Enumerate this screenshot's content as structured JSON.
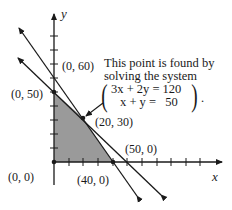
{
  "diagram": {
    "type": "linear-programming-feasible-region",
    "axes": {
      "x_label": "x",
      "y_label": "y",
      "tick_interval": 10
    },
    "lines": [
      {
        "equation": "3x + 2y = 120",
        "intercepts": [
          [
            0,
            60
          ],
          [
            40,
            0
          ]
        ]
      },
      {
        "equation": "x + y = 50",
        "intercepts": [
          [
            0,
            50
          ],
          [
            50,
            0
          ]
        ]
      }
    ],
    "feasible_region_vertices": [
      [
        0,
        0
      ],
      [
        0,
        50
      ],
      [
        20,
        30
      ],
      [
        40,
        0
      ]
    ],
    "shade_color": "#9a9a9a",
    "line_color": "#1a1a1a"
  },
  "labels": {
    "y_axis": "y",
    "x_axis": "x",
    "p_0_60": "(0, 60)",
    "p_0_50": "(0, 50)",
    "p_20_30": "(20, 30)",
    "p_50_0": "(50, 0)",
    "p_0_0": "(0, 0)",
    "p_40_0": "(40, 0)"
  },
  "annotation": {
    "line1": "This point is found by",
    "line2": "solving the system",
    "eq1": "3x + 2y = 120",
    "eq2": "x + y =   50",
    "trailing": "."
  }
}
